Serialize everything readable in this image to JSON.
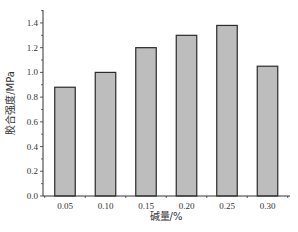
{
  "chart_data": {
    "type": "bar",
    "title": "",
    "xlabel": "碱量/%",
    "ylabel": "胶合强度/MPa",
    "categories": [
      "0.05",
      "0.10",
      "0.15",
      "0.20",
      "0.25",
      "0.30"
    ],
    "values": [
      0.88,
      1.0,
      1.2,
      1.3,
      1.38,
      1.05
    ],
    "ylim": [
      0,
      1.5
    ],
    "yticks": [
      "0.0",
      "0.2",
      "0.4",
      "0.6",
      "0.8",
      "1.0",
      "1.2",
      "1.4"
    ],
    "grid": false,
    "legend": null,
    "colors": {
      "bar_fill": "#bdbdbd",
      "bar_edge": "#2a2a2a",
      "axis": "#333333"
    }
  }
}
